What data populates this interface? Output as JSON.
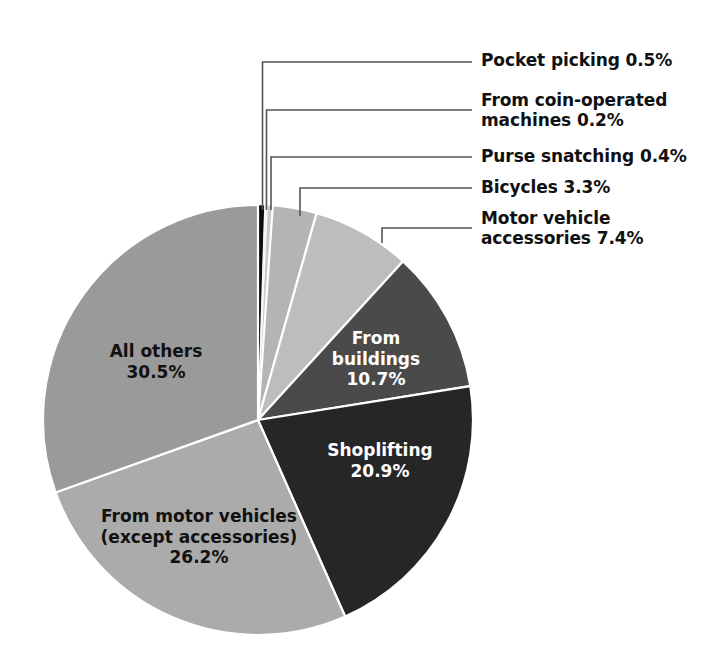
{
  "chart_data": {
    "type": "pie",
    "title": "",
    "subtitle": "",
    "xlabel": "",
    "ylabel": "",
    "units": "percent",
    "legend_position": "none",
    "grid": false,
    "start_angle_deg": 0,
    "direction": "clockwise",
    "categories": [
      "Pocket picking",
      "From coin-operated machines",
      "Purse snatching",
      "Bicycles",
      "Motor vehicle accessories",
      "From buildings",
      "Shoplifting",
      "From motor vehicles (except accessories)",
      "All others"
    ],
    "values": [
      0.5,
      0.2,
      0.4,
      3.3,
      7.4,
      10.7,
      20.9,
      26.2,
      30.5
    ],
    "slices": [
      {
        "id": "pocket-picking",
        "label": "Pocket picking",
        "value": 0.5,
        "value_text": "0.5%",
        "color": "#0d0d0d",
        "label_placement": "callout",
        "callout_text": "Pocket picking 0.5%"
      },
      {
        "id": "coin-operated-machines",
        "label": "From coin-operated machines",
        "value": 0.2,
        "value_text": "0.2%",
        "color": "#f2f2f2",
        "label_placement": "callout",
        "callout_text": "From coin-operated\nmachines 0.2%"
      },
      {
        "id": "purse-snatching",
        "label": "Purse snatching",
        "value": 0.4,
        "value_text": "0.4%",
        "color": "#c8c8c8",
        "label_placement": "callout",
        "callout_text": "Purse snatching 0.4%"
      },
      {
        "id": "bicycles",
        "label": "Bicycles",
        "value": 3.3,
        "value_text": "3.3%",
        "color": "#b4b4b4",
        "label_placement": "callout",
        "callout_text": "Bicycles 3.3%"
      },
      {
        "id": "motor-vehicle-accessories",
        "label": "Motor vehicle accessories",
        "value": 7.4,
        "value_text": "7.4%",
        "color": "#bdbdbd",
        "label_placement": "callout",
        "callout_text": "Motor vehicle\naccessories 7.4%"
      },
      {
        "id": "from-buildings",
        "label": "From buildings",
        "value": 10.7,
        "value_text": "10.7%",
        "color": "#4a4a4a",
        "label_placement": "inside",
        "text_color": "#ffffff",
        "inner_text": "From\nbuildings\n10.7%"
      },
      {
        "id": "shoplifting",
        "label": "Shoplifting",
        "value": 20.9,
        "value_text": "20.9%",
        "color": "#262626",
        "label_placement": "inside",
        "text_color": "#ffffff",
        "inner_text": "Shoplifting\n20.9%"
      },
      {
        "id": "from-motor-vehicles",
        "label": "From motor vehicles (except accessories)",
        "value": 26.2,
        "value_text": "26.2%",
        "color": "#ababab",
        "label_placement": "inside",
        "text_color": "#111111",
        "inner_text": "From motor vehicles\n(except accessories)\n26.2%"
      },
      {
        "id": "all-others",
        "label": "All others",
        "value": 30.5,
        "value_text": "30.5%",
        "color": "#9a9a9a",
        "label_placement": "inside",
        "text_color": "#111111",
        "inner_text": "All others\n30.5%"
      }
    ]
  },
  "callouts": {
    "pocket_picking": "Pocket picking 0.5%",
    "coin_operated": "From coin-operated\nmachines 0.2%",
    "purse_snatching": "Purse snatching 0.4%",
    "bicycles": "Bicycles 3.3%",
    "motor_vehicle_accessories": "Motor vehicle\naccessories 7.4%"
  },
  "inner_labels": {
    "from_buildings": "From\nbuildings\n10.7%",
    "shoplifting": "Shoplifting\n20.9%",
    "from_motor_vehicles": "From motor vehicles\n(except accessories)\n26.2%",
    "all_others": "All others\n30.5%"
  },
  "colors": {
    "background": "#ffffff",
    "leader_line": "#555555",
    "slice_border": "#ffffff",
    "text_dark": "#111111",
    "text_light": "#ffffff"
  }
}
